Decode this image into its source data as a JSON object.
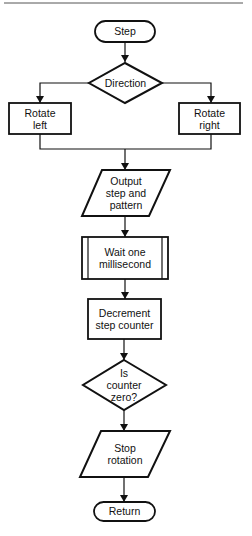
{
  "diagram": {
    "type": "flowchart",
    "nodes": [
      {
        "id": "step",
        "shape": "terminal",
        "label": "Step"
      },
      {
        "id": "direction",
        "shape": "decision",
        "label": "Direction"
      },
      {
        "id": "rotate_left",
        "shape": "process",
        "label": "Rotate\nleft"
      },
      {
        "id": "rotate_right",
        "shape": "process",
        "label": "Rotate\nright"
      },
      {
        "id": "output",
        "shape": "io",
        "label": "Output\nstep and\npattern"
      },
      {
        "id": "wait",
        "shape": "predefined-process",
        "label": "Wait one\nmillisecond"
      },
      {
        "id": "decrement",
        "shape": "process",
        "label": "Decrement\nstep counter"
      },
      {
        "id": "is_zero",
        "shape": "decision",
        "label": "Is\ncounter\nzero?"
      },
      {
        "id": "stop",
        "shape": "io",
        "label": "Stop\nrotation"
      },
      {
        "id": "return",
        "shape": "terminal",
        "label": "Return"
      }
    ],
    "edges": [
      {
        "from": "step",
        "to": "direction"
      },
      {
        "from": "direction",
        "to": "rotate_left"
      },
      {
        "from": "direction",
        "to": "rotate_right"
      },
      {
        "from": "rotate_left",
        "to": "output"
      },
      {
        "from": "rotate_right",
        "to": "output"
      },
      {
        "from": "output",
        "to": "wait"
      },
      {
        "from": "wait",
        "to": "decrement"
      },
      {
        "from": "decrement",
        "to": "is_zero"
      },
      {
        "from": "is_zero",
        "to": "stop"
      },
      {
        "from": "stop",
        "to": "return"
      }
    ],
    "colors": {
      "stroke": "#111111",
      "rule": "#555555",
      "background": "#ffffff"
    }
  },
  "labels": {
    "step": "Step",
    "direction": "Direction",
    "rotate_left": "Rotate\nleft",
    "rotate_right": "Rotate\nright",
    "output": "Output\nstep and\npattern",
    "wait": "Wait one\nmillisecond",
    "decrement": "Decrement\nstep counter",
    "is_zero": "Is\ncounter\nzero?",
    "stop": "Stop\nrotation",
    "return": "Return"
  }
}
